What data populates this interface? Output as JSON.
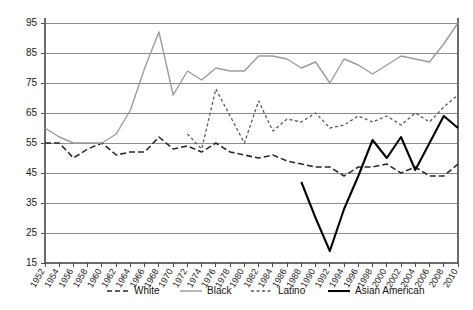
{
  "chart_data": {
    "type": "line",
    "title": "",
    "subtitle": "",
    "xlabel": "",
    "ylabel": "",
    "xlim": [
      1952,
      2010
    ],
    "ylim": [
      15,
      95
    ],
    "ytick_values": [
      15,
      25,
      35,
      45,
      55,
      65,
      75,
      85,
      95
    ],
    "ytick_labels": [
      "15",
      "25",
      "35",
      "45",
      "55",
      "65",
      "75",
      "85",
      "95"
    ],
    "grid": true,
    "grid_axis": "y",
    "legend_position": "bottom",
    "x": [
      1952,
      1954,
      1956,
      1958,
      1960,
      1962,
      1964,
      1966,
      1968,
      1970,
      1972,
      1974,
      1976,
      1978,
      1980,
      1982,
      1984,
      1986,
      1988,
      1990,
      1992,
      1994,
      1996,
      1998,
      2000,
      2002,
      2004,
      2006,
      2008,
      2010
    ],
    "xtick_labels": [
      "1952",
      "1954",
      "1956",
      "1958",
      "1960",
      "1962",
      "1964",
      "1966",
      "1968",
      "1970",
      "1972",
      "1974",
      "1976",
      "1978",
      "1980",
      "1982",
      "1984",
      "1986",
      "1988",
      "1990",
      "1992",
      "1994",
      "1996",
      "1998",
      "2000",
      "2002",
      "2004",
      "2006",
      "2008",
      "2010"
    ],
    "series": [
      {
        "name": "White",
        "color": "#2b2b2b",
        "style": "dashed",
        "dasharray": "6,3",
        "width": 1.6,
        "values": [
          55,
          55,
          50,
          53,
          55,
          51,
          52,
          52,
          57,
          53,
          54,
          52,
          55,
          52,
          51,
          50,
          51,
          49,
          48,
          47,
          47,
          44,
          47,
          47,
          48,
          45,
          47,
          44,
          44,
          48
        ]
      },
      {
        "name": "Black",
        "color": "#9c9c9c",
        "style": "solid",
        "dasharray": "none",
        "width": 1.4,
        "values": [
          60,
          57,
          55,
          55,
          55,
          58,
          66,
          80,
          92,
          71,
          79,
          76,
          80,
          79,
          79,
          84,
          84,
          83,
          80,
          82,
          75,
          83,
          81,
          78,
          81,
          84,
          83,
          82,
          88,
          95
        ]
      },
      {
        "name": "Latino",
        "color": "#5a5a5a",
        "style": "dotted",
        "dasharray": "3,2.5",
        "width": 1.3,
        "values": [
          null,
          null,
          null,
          null,
          null,
          null,
          null,
          null,
          null,
          null,
          58,
          53,
          73,
          64,
          55,
          69,
          59,
          63,
          62,
          65,
          60,
          61,
          64,
          62,
          64,
          61,
          65,
          62,
          67,
          71
        ]
      },
      {
        "name": "Asian American",
        "color": "#000000",
        "style": "solid",
        "dasharray": "none",
        "width": 2.1,
        "values": [
          null,
          null,
          null,
          null,
          null,
          null,
          null,
          null,
          null,
          null,
          null,
          null,
          null,
          null,
          null,
          null,
          null,
          null,
          42,
          30,
          19,
          33,
          44,
          56,
          50,
          57,
          46,
          55,
          64,
          60
        ]
      }
    ]
  },
  "legend": {
    "items": [
      {
        "label": "White",
        "color": "#2b2b2b",
        "dasharray": "5,3",
        "width": 1.6
      },
      {
        "label": "Black",
        "color": "#9c9c9c",
        "dasharray": "none",
        "width": 1.4
      },
      {
        "label": "Latino",
        "color": "#5a5a5a",
        "dasharray": "3,2.5",
        "width": 1.3
      },
      {
        "label": "Asian American",
        "color": "#000000",
        "dasharray": "none",
        "width": 2.1
      }
    ]
  }
}
